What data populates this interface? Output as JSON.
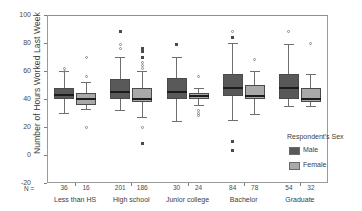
{
  "chart_data": {
    "type": "boxplot",
    "title": "",
    "xlabel": "",
    "ylabel": "Number of Hours Worked Last Week",
    "ylim": [
      -20,
      100
    ],
    "yticks": [
      100,
      80,
      60,
      40,
      20,
      0,
      -20
    ],
    "grid": false,
    "legend_position": "right",
    "legend_title": "Respondent's Sex",
    "n_prefix": "N =",
    "categories": [
      "Less than HS",
      "High school",
      "Junior college",
      "Bachelor",
      "Graduate"
    ],
    "series": [
      {
        "name": "Male",
        "color": "#595959",
        "n": [
          36,
          201,
          30,
          84,
          54
        ],
        "boxes": [
          {
            "whisker_low": 30,
            "q1": 40,
            "median": 43,
            "q3": 48,
            "whisker_high": 60,
            "outliers_o": [
              60,
              62
            ],
            "outliers_x": []
          },
          {
            "whisker_low": 32,
            "q1": 40,
            "median": 45,
            "q3": 54,
            "whisker_high": 70,
            "outliers_o": [
              76,
              79
            ],
            "outliers_x": [
              88
            ]
          },
          {
            "whisker_low": 24,
            "q1": 40,
            "median": 45,
            "q3": 55,
            "whisker_high": 70,
            "outliers_o": [],
            "outliers_x": [
              79
            ]
          },
          {
            "whisker_low": 25,
            "q1": 42,
            "median": 48,
            "q3": 58,
            "whisker_high": 80,
            "outliers_o": [
              88
            ],
            "outliers_x": [
              84,
              10,
              3
            ]
          },
          {
            "whisker_low": 35,
            "q1": 40,
            "median": 48,
            "q3": 58,
            "whisker_high": 79,
            "outliers_o": [
              88
            ],
            "outliers_x": []
          }
        ]
      },
      {
        "name": "Female",
        "color": "#a9a9a9",
        "n": [
          16,
          186,
          24,
          78,
          32
        ],
        "boxes": [
          {
            "whisker_low": 33,
            "q1": 36,
            "median": 40,
            "q3": 44,
            "whisker_high": 52,
            "outliers_o": [
              20,
              56,
              70
            ],
            "outliers_x": []
          },
          {
            "whisker_low": 27,
            "q1": 38,
            "median": 40,
            "q3": 48,
            "whisker_high": 60,
            "outliers_o": [
              62,
              64,
              66,
              20
            ],
            "outliers_x": [
              70,
              74,
              76,
              8
            ]
          },
          {
            "whisker_low": 36,
            "q1": 40,
            "median": 42,
            "q3": 44,
            "whisker_high": 48,
            "outliers_o": [
              32,
              30,
              28,
              56
            ],
            "outliers_x": []
          },
          {
            "whisker_low": 29,
            "q1": 40,
            "median": 42,
            "q3": 50,
            "whisker_high": 60,
            "outliers_o": [
              68
            ],
            "outliers_x": []
          },
          {
            "whisker_low": 35,
            "q1": 38,
            "median": 40,
            "q3": 48,
            "whisker_high": 58,
            "outliers_o": [
              80
            ],
            "outliers_x": []
          }
        ]
      }
    ]
  },
  "legend": {
    "title": "Respondent's Sex",
    "items": [
      {
        "label": "Male",
        "color": "#595959"
      },
      {
        "label": "Female",
        "color": "#a9a9a9"
      }
    ]
  },
  "axis": {
    "y_title": "Number of Hours Worked Last Week",
    "y_ticks": [
      "100",
      "80",
      "60",
      "40",
      "20",
      "0",
      "-20"
    ],
    "n_prefix": "N ="
  }
}
